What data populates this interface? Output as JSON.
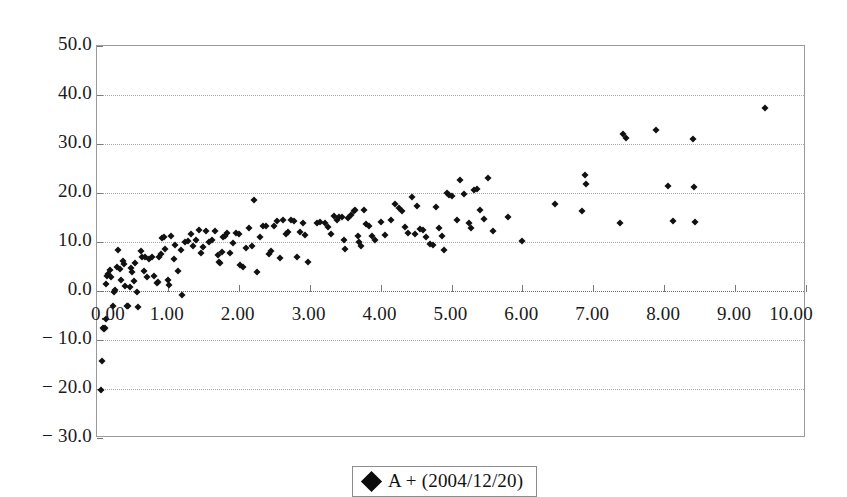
{
  "chart_data": {
    "type": "scatter",
    "title": "",
    "xlabel": "",
    "ylabel": "",
    "xlim": [
      0.0,
      10.0
    ],
    "ylim": [
      -30.0,
      50.0
    ],
    "grid": true,
    "legend_position": "bottom-center",
    "x_ticks": [
      "0.00",
      "1.00",
      "2.00",
      "3.00",
      "4.00",
      "5.00",
      "6.00",
      "7.00",
      "8.00",
      "9.00",
      "10.00"
    ],
    "x_tick_values": [
      0,
      1,
      2,
      3,
      4,
      5,
      6,
      7,
      8,
      9,
      10
    ],
    "y_ticks": [
      "50.0",
      "40.0",
      "30.0",
      "20.0",
      "10.0",
      "0.0",
      "− 10.0",
      "− 20.0",
      "− 30.0"
    ],
    "y_tick_values": [
      50,
      40,
      30,
      20,
      10,
      0,
      -10,
      -20,
      -30
    ],
    "series": [
      {
        "name": "A + (2004/12/20)",
        "marker": "diamond",
        "color": "#111111",
        "points": [
          [
            0.06,
            -20.2
          ],
          [
            0.07,
            -14.2
          ],
          [
            0.08,
            -7.6
          ],
          [
            0.11,
            -7.5
          ],
          [
            0.1,
            -7.8
          ],
          [
            0.13,
            -5.8
          ],
          [
            0.12,
            1.4
          ],
          [
            0.14,
            3.0
          ],
          [
            0.16,
            3.4
          ],
          [
            0.18,
            4.2
          ],
          [
            0.2,
            2.9
          ],
          [
            0.22,
            -3.1
          ],
          [
            0.24,
            -0.2
          ],
          [
            0.26,
            0.2
          ],
          [
            0.28,
            5.0
          ],
          [
            0.3,
            8.3
          ],
          [
            0.32,
            4.5
          ],
          [
            0.34,
            2.2
          ],
          [
            0.36,
            6.1
          ],
          [
            0.38,
            5.6
          ],
          [
            0.4,
            1.0
          ],
          [
            0.42,
            -3.0
          ],
          [
            0.44,
            -3.1
          ],
          [
            0.46,
            0.9
          ],
          [
            0.48,
            4.6
          ],
          [
            0.5,
            3.8
          ],
          [
            0.52,
            2.0
          ],
          [
            0.54,
            5.8
          ],
          [
            0.56,
            -0.2
          ],
          [
            0.58,
            -3.2
          ],
          [
            0.62,
            8.2
          ],
          [
            0.64,
            6.9
          ],
          [
            0.66,
            4.1
          ],
          [
            0.68,
            7.0
          ],
          [
            0.7,
            2.9
          ],
          [
            0.74,
            6.6
          ],
          [
            0.78,
            6.9
          ],
          [
            0.8,
            3.0
          ],
          [
            0.84,
            1.6
          ],
          [
            0.86,
            1.9
          ],
          [
            0.88,
            6.9
          ],
          [
            0.9,
            7.5
          ],
          [
            0.92,
            10.8
          ],
          [
            0.94,
            11.1
          ],
          [
            0.96,
            8.5
          ],
          [
            1.0,
            2.2
          ],
          [
            1.02,
            1.3
          ],
          [
            1.05,
            11.3
          ],
          [
            1.08,
            6.5
          ],
          [
            1.1,
            9.4
          ],
          [
            1.14,
            4.0
          ],
          [
            1.18,
            8.3
          ],
          [
            1.2,
            -0.9
          ],
          [
            1.24,
            9.9
          ],
          [
            1.28,
            10.3
          ],
          [
            1.32,
            11.6
          ],
          [
            1.36,
            9.2
          ],
          [
            1.4,
            10.4
          ],
          [
            1.44,
            12.4
          ],
          [
            1.46,
            7.8
          ],
          [
            1.5,
            9.0
          ],
          [
            1.54,
            12.2
          ],
          [
            1.58,
            9.9
          ],
          [
            1.62,
            10.4
          ],
          [
            1.66,
            12.3
          ],
          [
            1.7,
            7.3
          ],
          [
            1.72,
            6.0
          ],
          [
            1.74,
            5.8
          ],
          [
            1.76,
            8.0
          ],
          [
            1.78,
            11.0
          ],
          [
            1.8,
            11.2
          ],
          [
            1.84,
            11.9
          ],
          [
            1.88,
            7.8
          ],
          [
            1.92,
            9.7
          ],
          [
            1.96,
            11.8
          ],
          [
            2.0,
            11.7
          ],
          [
            2.02,
            5.4
          ],
          [
            2.06,
            4.8
          ],
          [
            2.1,
            8.7
          ],
          [
            2.14,
            12.9
          ],
          [
            2.18,
            9.2
          ],
          [
            2.22,
            18.5
          ],
          [
            2.26,
            3.8
          ],
          [
            2.3,
            11.0
          ],
          [
            2.34,
            13.2
          ],
          [
            2.38,
            13.3
          ],
          [
            2.42,
            7.5
          ],
          [
            2.46,
            8.1
          ],
          [
            2.5,
            13.3
          ],
          [
            2.54,
            14.3
          ],
          [
            2.58,
            6.8
          ],
          [
            2.62,
            14.4
          ],
          [
            2.66,
            11.6
          ],
          [
            2.7,
            12.1
          ],
          [
            2.74,
            14.4
          ],
          [
            2.78,
            14.3
          ],
          [
            2.82,
            7.0
          ],
          [
            2.86,
            12.0
          ],
          [
            2.9,
            13.8
          ],
          [
            2.94,
            11.4
          ],
          [
            2.98,
            5.9
          ],
          [
            3.1,
            13.9
          ],
          [
            3.14,
            14.0
          ],
          [
            3.22,
            13.8
          ],
          [
            3.26,
            13.0
          ],
          [
            3.3,
            11.6
          ],
          [
            3.34,
            15.3
          ],
          [
            3.38,
            14.4
          ],
          [
            3.42,
            15.2
          ],
          [
            3.46,
            15.1
          ],
          [
            3.48,
            10.5
          ],
          [
            3.5,
            8.6
          ],
          [
            3.54,
            14.9
          ],
          [
            3.58,
            15.6
          ],
          [
            3.62,
            16.4
          ],
          [
            3.64,
            16.6
          ],
          [
            3.68,
            11.3
          ],
          [
            3.7,
            10.1
          ],
          [
            3.72,
            9.1
          ],
          [
            3.76,
            16.6
          ],
          [
            3.8,
            13.7
          ],
          [
            3.84,
            13.3
          ],
          [
            3.88,
            11.3
          ],
          [
            3.92,
            10.4
          ],
          [
            4.0,
            14.1
          ],
          [
            4.06,
            11.4
          ],
          [
            4.14,
            14.5
          ],
          [
            4.2,
            17.8
          ],
          [
            4.26,
            16.9
          ],
          [
            4.3,
            16.4
          ],
          [
            4.34,
            13.0
          ],
          [
            4.38,
            11.9
          ],
          [
            4.44,
            19.2
          ],
          [
            4.48,
            11.6
          ],
          [
            4.52,
            17.4
          ],
          [
            4.56,
            12.7
          ],
          [
            4.6,
            12.5
          ],
          [
            4.64,
            11.0
          ],
          [
            4.7,
            9.5
          ],
          [
            4.74,
            9.4
          ],
          [
            4.78,
            17.1
          ],
          [
            4.82,
            12.8
          ],
          [
            4.86,
            11.2
          ],
          [
            4.9,
            8.4
          ],
          [
            4.94,
            20.0
          ],
          [
            4.96,
            19.6
          ],
          [
            5.0,
            19.4
          ],
          [
            5.08,
            14.4
          ],
          [
            5.12,
            22.6
          ],
          [
            5.18,
            19.8
          ],
          [
            5.24,
            13.8
          ],
          [
            5.28,
            12.9
          ],
          [
            5.32,
            20.6
          ],
          [
            5.36,
            20.9
          ],
          [
            5.4,
            16.5
          ],
          [
            5.46,
            14.6
          ],
          [
            5.52,
            23.1
          ],
          [
            5.58,
            12.2
          ],
          [
            5.8,
            15.2
          ],
          [
            6.0,
            10.3
          ],
          [
            6.46,
            17.8
          ],
          [
            6.84,
            16.4
          ],
          [
            6.88,
            23.6
          ],
          [
            6.9,
            21.9
          ],
          [
            7.38,
            13.9
          ],
          [
            7.42,
            32.1
          ],
          [
            7.46,
            31.2
          ],
          [
            7.88,
            32.8
          ],
          [
            8.06,
            21.4
          ],
          [
            8.12,
            14.2
          ],
          [
            8.4,
            31.0
          ],
          [
            8.42,
            21.3
          ],
          [
            8.44,
            14.0
          ],
          [
            9.42,
            37.3
          ]
        ]
      }
    ]
  },
  "legend": {
    "label": "A + (2004/12/20)",
    "marker_icon": "diamond-marker-icon"
  }
}
